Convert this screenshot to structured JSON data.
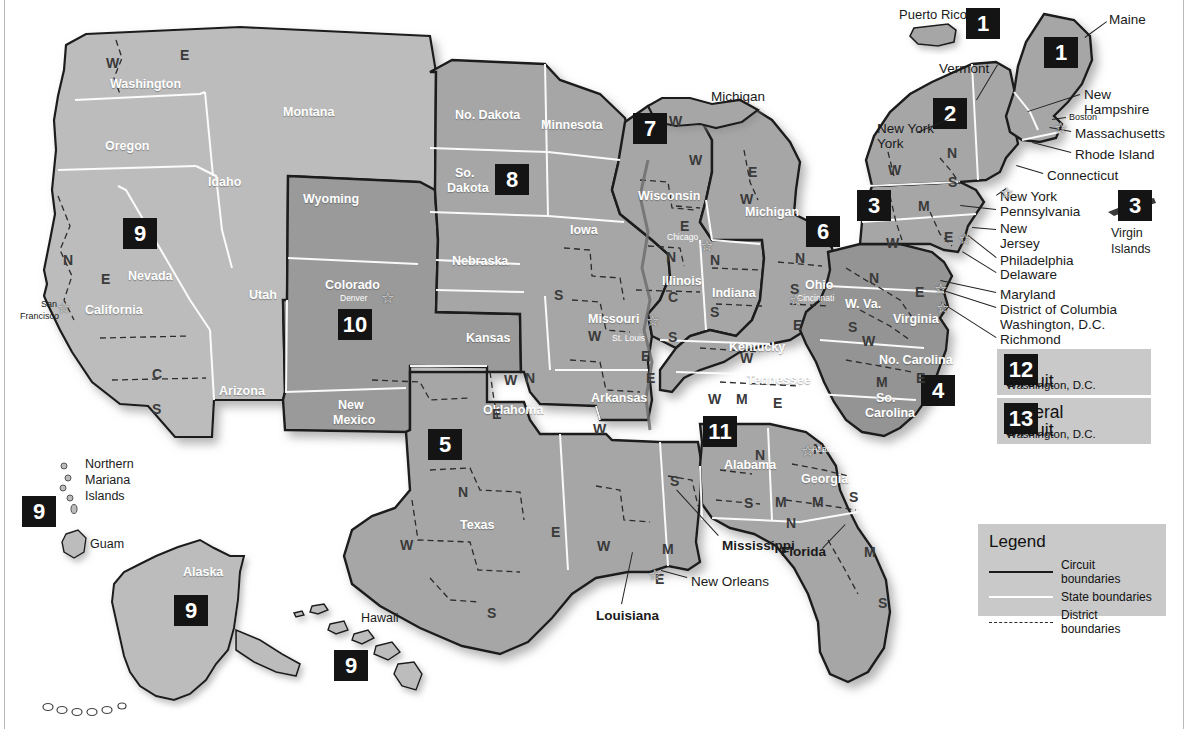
{
  "colors": {
    "background": "#ffffff",
    "badge_bg": "#141414",
    "badge_text": "#ffffff",
    "land_light": "#bcbcbc",
    "land_mid": "#a6a6a6",
    "land_dark": "#949494",
    "state_border": "#ffffff",
    "circuit_border": "#1b1b1b",
    "district_border": "#2a2a2a",
    "panel_bg": "#c9c9c9"
  },
  "circuit_badges": [
    {
      "id": "badge-1-puerto-rico",
      "number": "1",
      "x": 966,
      "y": 8,
      "size": "sz2"
    },
    {
      "id": "badge-1-maine",
      "number": "1",
      "x": 1044,
      "y": 37,
      "size": "sz2"
    },
    {
      "id": "badge-2",
      "number": "2",
      "x": 933,
      "y": 98,
      "size": "sz2"
    },
    {
      "id": "badge-3-mainland",
      "number": "3",
      "x": 857,
      "y": 190,
      "size": "sz2"
    },
    {
      "id": "badge-3-virgin-islands",
      "number": "3",
      "x": 1118,
      "y": 190,
      "size": "sz2"
    },
    {
      "id": "badge-4",
      "number": "4",
      "x": 921,
      "y": 375,
      "size": "sz2"
    },
    {
      "id": "badge-5",
      "number": "5",
      "x": 428,
      "y": 429,
      "size": "sz2"
    },
    {
      "id": "badge-6",
      "number": "6",
      "x": 806,
      "y": 216,
      "size": "sz2"
    },
    {
      "id": "badge-7",
      "number": "7",
      "x": 633,
      "y": 113,
      "size": "sz2"
    },
    {
      "id": "badge-8",
      "number": "8",
      "x": 495,
      "y": 164,
      "size": "sz2"
    },
    {
      "id": "badge-9-nevada",
      "number": "9",
      "x": 123,
      "y": 218,
      "size": "sz2"
    },
    {
      "id": "badge-9-mariana",
      "number": "9",
      "x": 22,
      "y": 496,
      "size": "sz2"
    },
    {
      "id": "badge-9-alaska",
      "number": "9",
      "x": 174,
      "y": 595,
      "size": "sz2"
    },
    {
      "id": "badge-9-hawaii",
      "number": "9",
      "x": 334,
      "y": 650,
      "size": "sz2"
    },
    {
      "id": "badge-10",
      "number": "10",
      "x": 338,
      "y": 309,
      "size": "sz2"
    },
    {
      "id": "badge-11",
      "number": "11",
      "x": 703,
      "y": 416,
      "size": "sz2"
    }
  ],
  "circuit_cards": [
    {
      "number": "12",
      "name_line1": "D.C.",
      "name_line2": "Circuit",
      "location": "Washington, D.C."
    },
    {
      "number": "13",
      "name_line1": "Federal",
      "name_line2": "Circuit",
      "location": "Washington, D.C."
    }
  ],
  "legend": {
    "title": "Legend",
    "items": [
      {
        "key": "circuit",
        "label": "Circuit boundaries"
      },
      {
        "key": "state",
        "label": "State boundaries"
      },
      {
        "key": "district",
        "label": "District boundaries"
      }
    ]
  },
  "state_labels": [
    {
      "name": "Washington",
      "x": 110,
      "y": 78,
      "cls": "state-w"
    },
    {
      "name": "Oregon",
      "x": 105,
      "y": 140,
      "cls": "state-w"
    },
    {
      "name": "Idaho",
      "x": 208,
      "y": 176,
      "cls": "state-w"
    },
    {
      "name": "Montana",
      "x": 283,
      "y": 106,
      "cls": "state-w"
    },
    {
      "name": "Nevada",
      "x": 128,
      "y": 270,
      "cls": "state-w"
    },
    {
      "name": "California",
      "x": 85,
      "y": 304,
      "cls": "state-w"
    },
    {
      "name": "Utah",
      "x": 249,
      "y": 289,
      "cls": "state-w"
    },
    {
      "name": "Arizona",
      "x": 219,
      "y": 385,
      "cls": "state-w"
    },
    {
      "name": "Wyoming",
      "x": 303,
      "y": 193,
      "cls": "state-w"
    },
    {
      "name": "Colorado",
      "x": 325,
      "y": 279,
      "cls": "state-w"
    },
    {
      "name": "New",
      "x": 338,
      "y": 399,
      "cls": "state-w"
    },
    {
      "name": "Mexico",
      "x": 333,
      "y": 414,
      "cls": "state-w"
    },
    {
      "name": "No. Dakota",
      "x": 455,
      "y": 109,
      "cls": "state-w"
    },
    {
      "name": "So.",
      "x": 455,
      "y": 167,
      "cls": "state-w"
    },
    {
      "name": "Dakota",
      "x": 447,
      "y": 182,
      "cls": "state-w"
    },
    {
      "name": "Nebraska",
      "x": 452,
      "y": 255,
      "cls": "state-w"
    },
    {
      "name": "Kansas",
      "x": 466,
      "y": 332,
      "cls": "state-w"
    },
    {
      "name": "Oklahoma",
      "x": 483,
      "y": 404,
      "cls": "state-w"
    },
    {
      "name": "Texas",
      "x": 460,
      "y": 519,
      "cls": "state-w"
    },
    {
      "name": "Minnesota",
      "x": 541,
      "y": 119,
      "cls": "state-w"
    },
    {
      "name": "Iowa",
      "x": 570,
      "y": 224,
      "cls": "state-w"
    },
    {
      "name": "Missouri",
      "x": 588,
      "y": 313,
      "cls": "state-w"
    },
    {
      "name": "Arkansas",
      "x": 591,
      "y": 392,
      "cls": "state-w"
    },
    {
      "name": "Wisconsin",
      "x": 638,
      "y": 190,
      "cls": "state-w"
    },
    {
      "name": "Illinois",
      "x": 662,
      "y": 275,
      "cls": "state-w"
    },
    {
      "name": "Indiana",
      "x": 712,
      "y": 287,
      "cls": "state-w"
    },
    {
      "name": "Michigan",
      "x": 745,
      "y": 206,
      "cls": "state-w"
    },
    {
      "name": "Ohio",
      "x": 805,
      "y": 279,
      "cls": "state-w"
    },
    {
      "name": "Kentucky",
      "x": 729,
      "y": 341,
      "cls": "state-w"
    },
    {
      "name": "Tennessee",
      "x": 747,
      "y": 374,
      "cls": "state-w"
    },
    {
      "name": "W. Va.",
      "x": 845,
      "y": 298,
      "cls": "state-w"
    },
    {
      "name": "Virginia",
      "x": 893,
      "y": 313,
      "cls": "state-w"
    },
    {
      "name": "No. Carolina",
      "x": 879,
      "y": 354,
      "cls": "state-w"
    },
    {
      "name": "So.",
      "x": 876,
      "y": 392,
      "cls": "state-w"
    },
    {
      "name": "Carolina",
      "x": 865,
      "y": 407,
      "cls": "state-w"
    },
    {
      "name": "Alabama",
      "x": 724,
      "y": 459,
      "cls": "state-w"
    },
    {
      "name": "Georgia",
      "x": 801,
      "y": 473,
      "cls": "state-w"
    },
    {
      "name": "Alaska",
      "x": 183,
      "y": 566,
      "cls": "state-w"
    }
  ],
  "outside_labels": [
    {
      "name": "Michigan",
      "x": 711,
      "y": 90,
      "bold": false
    },
    {
      "name": "Maine",
      "x": 1109,
      "y": 13,
      "bold": false
    },
    {
      "name": "Vermont",
      "x": 939,
      "y": 62,
      "bold": false
    },
    {
      "name": "New",
      "x": 1084,
      "y": 88,
      "bold": false
    },
    {
      "name": "Hampshire",
      "x": 1084,
      "y": 103,
      "bold": false
    },
    {
      "name": "Massachusetts",
      "x": 1075,
      "y": 127,
      "bold": false
    },
    {
      "name": "Rhode Island",
      "x": 1075,
      "y": 148,
      "bold": false
    },
    {
      "name": "Connecticut",
      "x": 1047,
      "y": 169,
      "bold": false
    },
    {
      "name": "New York",
      "x": 877,
      "y": 122,
      "bold": false
    },
    {
      "name": "York",
      "x": 877,
      "y": 137,
      "bold": false
    },
    {
      "name": "New York",
      "x": 1000,
      "y": 190,
      "bold": false
    },
    {
      "name": "Pennsylvania",
      "x": 1000,
      "y": 205,
      "bold": false
    },
    {
      "name": "New",
      "x": 1000,
      "y": 222,
      "bold": false
    },
    {
      "name": "Jersey",
      "x": 1000,
      "y": 237,
      "bold": false
    },
    {
      "name": "Philadelphia",
      "x": 1000,
      "y": 254,
      "bold": false
    },
    {
      "name": "Delaware",
      "x": 1000,
      "y": 268,
      "bold": false
    },
    {
      "name": "Maryland",
      "x": 1000,
      "y": 288,
      "bold": false
    },
    {
      "name": "District of Columbia",
      "x": 1000,
      "y": 303,
      "bold": false
    },
    {
      "name": "Washington, D.C.",
      "x": 1000,
      "y": 318,
      "bold": false
    },
    {
      "name": "Richmond",
      "x": 1000,
      "y": 333,
      "bold": false
    },
    {
      "name": "Mississippi",
      "x": 722,
      "y": 539,
      "bold": true
    },
    {
      "name": "Louisiana",
      "x": 596,
      "y": 609,
      "bold": true
    },
    {
      "name": "Florida",
      "x": 781,
      "y": 545,
      "bold": true
    },
    {
      "name": "New Orleans",
      "x": 691,
      "y": 575,
      "bold": false
    }
  ],
  "island_labels": [
    {
      "name": "Puerto Rico",
      "x": 899,
      "y": 8,
      "size": 13
    },
    {
      "name": "Virgin",
      "x": 1111,
      "y": 227,
      "size": 12.5
    },
    {
      "name": "Islands",
      "x": 1111,
      "y": 243,
      "size": 12.5
    },
    {
      "name": "Northern",
      "x": 85,
      "y": 458,
      "size": 12.5
    },
    {
      "name": "Mariana",
      "x": 85,
      "y": 474,
      "size": 12.5
    },
    {
      "name": "Islands",
      "x": 85,
      "y": 490,
      "size": 12.5
    },
    {
      "name": "Guam",
      "x": 90,
      "y": 538,
      "size": 12.5
    },
    {
      "name": "Hawaii",
      "x": 361,
      "y": 612,
      "size": 12.5
    }
  ],
  "cities": [
    {
      "name": "San",
      "x": 41,
      "y": 300,
      "style": "dark"
    },
    {
      "name": "Francisco",
      "x": 20,
      "y": 312,
      "style": "dark"
    },
    {
      "name": "Denver",
      "x": 340,
      "y": 294,
      "style": "light"
    },
    {
      "name": "Chicago",
      "x": 667,
      "y": 233,
      "style": "light"
    },
    {
      "name": "St. Louis",
      "x": 612,
      "y": 334,
      "style": "light"
    },
    {
      "name": "Cincinnati",
      "x": 797,
      "y": 294,
      "style": "light"
    },
    {
      "name": "Atlanta",
      "x": 812,
      "y": 445,
      "style": "light"
    },
    {
      "name": "Boston",
      "x": 1069,
      "y": 113,
      "style": "dark"
    }
  ],
  "city_stars": [
    {
      "name": "star-san-francisco",
      "x": 57,
      "y": 300
    },
    {
      "name": "star-denver",
      "x": 381,
      "y": 290
    },
    {
      "name": "star-chicago",
      "x": 700,
      "y": 238
    },
    {
      "name": "star-st-louis",
      "x": 646,
      "y": 313
    },
    {
      "name": "star-cincinnati",
      "x": 789,
      "y": 292
    },
    {
      "name": "star-atlanta",
      "x": 801,
      "y": 443
    },
    {
      "name": "star-new-orleans",
      "x": 648,
      "y": 567
    },
    {
      "name": "star-boston",
      "x": 1054,
      "y": 120
    },
    {
      "name": "star-new-york",
      "x": 1000,
      "y": 185
    },
    {
      "name": "star-philadelphia",
      "x": 958,
      "y": 231
    },
    {
      "name": "star-baltimore",
      "x": 934,
      "y": 281
    },
    {
      "name": "star-richmond",
      "x": 936,
      "y": 300
    }
  ],
  "division_letters": [
    {
      "t": "W",
      "x": 106,
      "y": 56
    },
    {
      "t": "E",
      "x": 180,
      "y": 48
    },
    {
      "t": "N",
      "x": 63,
      "y": 253
    },
    {
      "t": "E",
      "x": 101,
      "y": 272
    },
    {
      "t": "C",
      "x": 152,
      "y": 367
    },
    {
      "t": "S",
      "x": 152,
      "y": 402
    },
    {
      "t": "W",
      "x": 504,
      "y": 373
    },
    {
      "t": "N",
      "x": 525,
      "y": 371
    },
    {
      "t": "E",
      "x": 492,
      "y": 407
    },
    {
      "t": "N",
      "x": 458,
      "y": 485
    },
    {
      "t": "W",
      "x": 400,
      "y": 538
    },
    {
      "t": "E",
      "x": 551,
      "y": 525
    },
    {
      "t": "S",
      "x": 487,
      "y": 606
    },
    {
      "t": "S",
      "x": 554,
      "y": 288
    },
    {
      "t": "W",
      "x": 588,
      "y": 329
    },
    {
      "t": "E",
      "x": 641,
      "y": 349
    },
    {
      "t": "E",
      "x": 646,
      "y": 371
    },
    {
      "t": "W",
      "x": 593,
      "y": 422
    },
    {
      "t": "W",
      "x": 689,
      "y": 153
    },
    {
      "t": "E",
      "x": 680,
      "y": 219
    },
    {
      "t": "N",
      "x": 666,
      "y": 250
    },
    {
      "t": "C",
      "x": 668,
      "y": 290
    },
    {
      "t": "S",
      "x": 668,
      "y": 330
    },
    {
      "t": "N",
      "x": 710,
      "y": 253
    },
    {
      "t": "S",
      "x": 710,
      "y": 305
    },
    {
      "t": "W",
      "x": 669,
      "y": 114
    },
    {
      "t": "E",
      "x": 748,
      "y": 165
    },
    {
      "t": "W",
      "x": 740,
      "y": 192
    },
    {
      "t": "N",
      "x": 795,
      "y": 251
    },
    {
      "t": "S",
      "x": 790,
      "y": 282
    },
    {
      "t": "E",
      "x": 793,
      "y": 318
    },
    {
      "t": "W",
      "x": 740,
      "y": 351
    },
    {
      "t": "E",
      "x": 773,
      "y": 396
    },
    {
      "t": "W",
      "x": 708,
      "y": 392
    },
    {
      "t": "M",
      "x": 736,
      "y": 392
    },
    {
      "t": "W",
      "x": 888,
      "y": 163
    },
    {
      "t": "N",
      "x": 947,
      "y": 146
    },
    {
      "t": "S",
      "x": 948,
      "y": 175
    },
    {
      "t": "M",
      "x": 918,
      "y": 199
    },
    {
      "t": "W",
      "x": 886,
      "y": 236
    },
    {
      "t": "E",
      "x": 944,
      "y": 230
    },
    {
      "t": "N",
      "x": 869,
      "y": 271
    },
    {
      "t": "S",
      "x": 848,
      "y": 320
    },
    {
      "t": "E",
      "x": 915,
      "y": 285
    },
    {
      "t": "W",
      "x": 862,
      "y": 334
    },
    {
      "t": "E",
      "x": 916,
      "y": 371
    },
    {
      "t": "M",
      "x": 876,
      "y": 375
    },
    {
      "t": "N",
      "x": 755,
      "y": 448
    },
    {
      "t": "N",
      "x": 813,
      "y": 442
    },
    {
      "t": "S",
      "x": 744,
      "y": 496
    },
    {
      "t": "M",
      "x": 775,
      "y": 495
    },
    {
      "t": "M",
      "x": 812,
      "y": 495
    },
    {
      "t": "S",
      "x": 849,
      "y": 490
    },
    {
      "t": "N",
      "x": 786,
      "y": 516
    },
    {
      "t": "M",
      "x": 864,
      "y": 545
    },
    {
      "t": "S",
      "x": 878,
      "y": 596
    },
    {
      "t": "S",
      "x": 670,
      "y": 474
    },
    {
      "t": "M",
      "x": 662,
      "y": 542
    },
    {
      "t": "E",
      "x": 655,
      "y": 572
    },
    {
      "t": "W",
      "x": 597,
      "y": 539
    }
  ],
  "leader_lines": [
    {
      "name": "leader-vermont",
      "x1": 998,
      "y1": 65,
      "x2": 977,
      "y2": 100
    },
    {
      "name": "leader-maine",
      "x1": 1107,
      "y1": 22,
      "x2": 1085,
      "y2": 38
    },
    {
      "name": "leader-new-hampshire",
      "x1": 1080,
      "y1": 95,
      "x2": 1028,
      "y2": 112
    },
    {
      "name": "leader-boston",
      "x1": 1066,
      "y1": 118,
      "x2": 1052,
      "y2": 120
    },
    {
      "name": "leader-massachusetts",
      "x1": 1071,
      "y1": 132,
      "x2": 1049,
      "y2": 128
    },
    {
      "name": "leader-rhode-island",
      "x1": 1071,
      "y1": 153,
      "x2": 1032,
      "y2": 143
    },
    {
      "name": "leader-connecticut",
      "x1": 1043,
      "y1": 174,
      "x2": 1016,
      "y2": 166
    },
    {
      "name": "leader-new-york-state",
      "x1": 917,
      "y1": 132,
      "x2": 950,
      "y2": 118
    },
    {
      "name": "leader-new-york-city",
      "x1": 996,
      "y1": 195,
      "x2": 1006,
      "y2": 188
    },
    {
      "name": "leader-pennsylvania",
      "x1": 996,
      "y1": 210,
      "x2": 960,
      "y2": 206
    },
    {
      "name": "leader-new-jersey",
      "x1": 996,
      "y1": 230,
      "x2": 972,
      "y2": 228
    },
    {
      "name": "leader-philadelphia",
      "x1": 996,
      "y1": 258,
      "x2": 968,
      "y2": 236
    },
    {
      "name": "leader-delaware",
      "x1": 996,
      "y1": 273,
      "x2": 962,
      "y2": 252
    },
    {
      "name": "leader-maryland",
      "x1": 996,
      "y1": 293,
      "x2": 940,
      "y2": 281
    },
    {
      "name": "leader-dc",
      "x1": 996,
      "y1": 308,
      "x2": 940,
      "y2": 290
    },
    {
      "name": "leader-richmond",
      "x1": 996,
      "y1": 338,
      "x2": 941,
      "y2": 303
    },
    {
      "name": "leader-mississippi",
      "x1": 718,
      "y1": 536,
      "x2": 676,
      "y2": 490
    },
    {
      "name": "leader-louisiana",
      "x1": 621,
      "y1": 604,
      "x2": 632,
      "y2": 552
    },
    {
      "name": "leader-florida",
      "x1": 822,
      "y1": 548,
      "x2": 845,
      "y2": 524
    },
    {
      "name": "leader-new-orleans",
      "x1": 687,
      "y1": 578,
      "x2": 661,
      "y2": 571
    }
  ]
}
